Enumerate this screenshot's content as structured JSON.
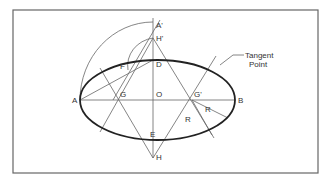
{
  "diagram": {
    "points": {
      "A": "A",
      "B": "B",
      "O": "O",
      "D": "D",
      "E": "E",
      "A_prime": "A'",
      "H_prime": "H'",
      "H": "H",
      "G": "G",
      "G_prime": "G'",
      "F": "F"
    },
    "radius_labels": [
      "R",
      "R"
    ],
    "callout": {
      "line1": "Tangent",
      "line2": "Point"
    }
  }
}
